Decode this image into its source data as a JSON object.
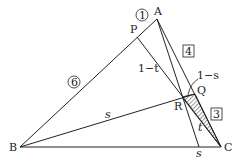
{
  "points": {
    "A": {
      "label": "A",
      "x": 157,
      "y": 19
    },
    "B": {
      "label": "B",
      "x": 20,
      "y": 147
    },
    "C": {
      "label": "C",
      "x": 221,
      "y": 147
    },
    "P": {
      "label": "P",
      "x": 137,
      "y": 37
    },
    "Q": {
      "label": "Q",
      "x": 195,
      "y": 94
    },
    "R": {
      "label": "R",
      "x": 182,
      "y": 97
    },
    "S": {
      "x": 199,
      "y": 147
    }
  },
  "labels": {
    "ratio_AP": "1",
    "ratio_PB": "6",
    "ratio_AQ": "4",
    "ratio_QC": "3",
    "seg_1_minus_t": "1−t",
    "seg_1_minus_s": "1−s",
    "seg_s_BR": "s",
    "seg_t_RC": "t",
    "seg_s_base": "s"
  },
  "colors": {
    "line": "#222222",
    "hatch": "#333333"
  }
}
